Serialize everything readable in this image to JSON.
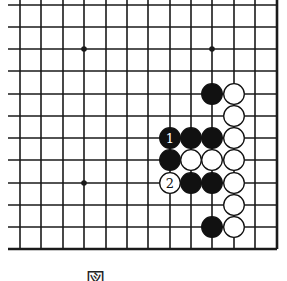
{
  "diagram": {
    "type": "go-board-fragment",
    "grid": {
      "columns_x": [
        20,
        41,
        63,
        84,
        106,
        127,
        148,
        170,
        191,
        212,
        234,
        255,
        277
      ],
      "rows_y": [
        5,
        27,
        49,
        71,
        94,
        116,
        138,
        160,
        183,
        205,
        227,
        249
      ],
      "open_left_extend_to": 8,
      "open_top_extend_to": 0,
      "right_edge": true,
      "bottom_edge": true,
      "line_color": "#1a1a1a"
    },
    "star_points": [
      {
        "col": 3,
        "row": 2
      },
      {
        "col": 9,
        "row": 2
      },
      {
        "col": 3,
        "row": 8
      }
    ],
    "stones": [
      {
        "color": "black",
        "col": 9,
        "row": 4
      },
      {
        "color": "white",
        "col": 10,
        "row": 4
      },
      {
        "color": "white",
        "col": 10,
        "row": 5
      },
      {
        "color": "black",
        "col": 7,
        "row": 6,
        "label": "1"
      },
      {
        "color": "black",
        "col": 8,
        "row": 6
      },
      {
        "color": "black",
        "col": 9,
        "row": 6
      },
      {
        "color": "white",
        "col": 10,
        "row": 6
      },
      {
        "color": "black",
        "col": 7,
        "row": 7
      },
      {
        "color": "white",
        "col": 8,
        "row": 7
      },
      {
        "color": "white",
        "col": 9,
        "row": 7
      },
      {
        "color": "white",
        "col": 10,
        "row": 7
      },
      {
        "color": "white",
        "col": 7,
        "row": 8,
        "label": "2"
      },
      {
        "color": "black",
        "col": 8,
        "row": 8
      },
      {
        "color": "black",
        "col": 9,
        "row": 8
      },
      {
        "color": "white",
        "col": 10,
        "row": 8
      },
      {
        "color": "white",
        "col": 10,
        "row": 9
      },
      {
        "color": "black",
        "col": 9,
        "row": 10
      },
      {
        "color": "white",
        "col": 10,
        "row": 10
      }
    ],
    "caption": "図"
  }
}
